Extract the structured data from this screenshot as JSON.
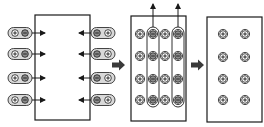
{
  "diagram": {
    "colors": {
      "stroke": "#1a1a1a",
      "capsule_fill": "#d9d9d9",
      "charge_fill": "#ffffff",
      "negative_fill": "#8c8c8c",
      "big_arrow": "#3a3a3a",
      "background": "#ffffff"
    },
    "symbols": {
      "positive": "+",
      "negative": "−"
    },
    "panels": [
      {
        "id": "panel-1",
        "label": "Charge pairs approaching box from both sides",
        "box": {
          "x": 35,
          "y": 15,
          "w": 55,
          "h": 105
        },
        "rows_y": [
          33,
          54,
          78,
          100
        ],
        "left_pairs": [
          "+",
          "−"
        ],
        "right_pairs": [
          "−",
          "+"
        ]
      },
      {
        "id": "panel-2",
        "label": "Charges inside box; negative charges extracted upward in columns",
        "box": {
          "x": 131,
          "y": 16,
          "w": 55,
          "h": 105
        },
        "rows_y": [
          34,
          56,
          79,
          100
        ],
        "columns": [
          {
            "x": 140,
            "sign": "+"
          },
          {
            "x": 153,
            "sign": "−",
            "extracted": true
          },
          {
            "x": 165,
            "sign": "+"
          },
          {
            "x": 178,
            "sign": "−",
            "extracted": true
          }
        ]
      },
      {
        "id": "panel-3",
        "label": "Only positive charges remain",
        "box": {
          "x": 207,
          "y": 17,
          "w": 55,
          "h": 105
        },
        "rows_y": [
          34,
          57,
          79,
          100
        ],
        "columns": [
          {
            "x": 223,
            "sign": "+"
          },
          {
            "x": 245,
            "sign": "+"
          }
        ]
      }
    ],
    "transition_arrows": [
      {
        "from": "panel-1",
        "to": "panel-2",
        "x": 118,
        "y": 65
      },
      {
        "from": "panel-2",
        "to": "panel-3",
        "x": 197,
        "y": 65
      }
    ]
  }
}
